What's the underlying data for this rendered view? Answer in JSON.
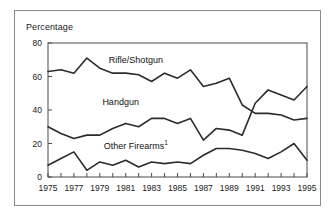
{
  "figure": {
    "y_axis_title": "Percentage",
    "border_color": "#8a8a8a",
    "line_color": "#2b2b2b",
    "background": "#ffffff"
  },
  "series_labels": {
    "rifle": "Rifle/Shotgun",
    "handgun": "Handgun",
    "other": "Other Firearms",
    "other_footnote": "1"
  },
  "ytick_labels": [
    "80",
    "60",
    "40",
    "20",
    "0"
  ],
  "xtick_labels": [
    "1975",
    "1977",
    "1979",
    "1981",
    "1983",
    "1985",
    "1987",
    "1989",
    "1991",
    "1993",
    "1995"
  ],
  "chart_data": {
    "type": "line",
    "title": "",
    "subtitle": "",
    "xlabel": "",
    "ylabel": "Percentage",
    "xlim": [
      1975,
      1995
    ],
    "ylim": [
      0,
      80
    ],
    "ytick_values": [
      0,
      20,
      40,
      60,
      80
    ],
    "xtick_values": [
      1975,
      1977,
      1979,
      1981,
      1983,
      1985,
      1987,
      1989,
      1991,
      1993,
      1995
    ],
    "xtick_minor_every": 1,
    "grid": false,
    "legend_position": "inline-labels",
    "annotations": [
      {
        "text": "Rifle/Shotgun",
        "x": 1979.7,
        "y": 69
      },
      {
        "text": "Handgun",
        "x": 1979.2,
        "y": 44
      },
      {
        "text": "Other Firearms1",
        "x": 1979.3,
        "y": 18
      }
    ],
    "x": [
      1975,
      1976,
      1977,
      1978,
      1979,
      1980,
      1981,
      1982,
      1983,
      1984,
      1985,
      1986,
      1987,
      1988,
      1989,
      1990,
      1991,
      1992,
      1993,
      1994,
      1995
    ],
    "series": [
      {
        "name": "Rifle/Shotgun",
        "values": [
          63,
          64,
          62,
          71,
          65,
          62,
          62,
          61,
          57,
          62,
          59,
          64,
          54,
          56,
          59,
          43,
          38,
          38,
          37,
          34,
          35
        ]
      },
      {
        "name": "Handgun",
        "values": [
          30,
          26,
          23,
          25,
          25,
          29,
          32,
          30,
          35,
          35,
          32,
          35,
          22,
          29,
          28,
          25,
          44,
          52,
          49,
          46,
          54
        ]
      },
      {
        "name": "Other Firearms",
        "values": [
          7,
          11,
          15,
          4,
          9,
          7,
          10,
          6,
          9,
          8,
          9,
          8,
          13,
          17,
          17,
          16,
          14,
          11,
          15,
          20,
          10
        ]
      }
    ]
  }
}
